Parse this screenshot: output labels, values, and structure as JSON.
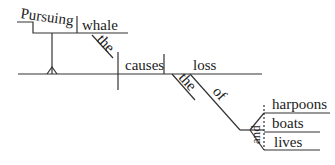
{
  "diagram": {
    "type": "sentence-diagram",
    "sentence": "Pursuing the whale causes the loss of harpoons, boats and lives",
    "subject_phrase": {
      "gerund": "Pursuing",
      "object": "whale",
      "object_modifier": "the"
    },
    "verb": "causes",
    "direct_object": "loss",
    "object_modifier": "the",
    "preposition": "of",
    "conjunction": "and",
    "prepositional_objects": [
      "harpoons",
      "boats",
      "lives"
    ]
  }
}
